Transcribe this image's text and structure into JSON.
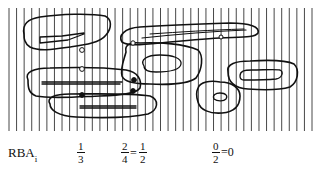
{
  "figure": {
    "type": "ribbon-grid-diagram",
    "vertical_lines": {
      "count": 41,
      "x_start": 9,
      "x_end": 312,
      "y_top": 8,
      "y_bottom": 131,
      "color": "#333333"
    },
    "shape_color": "#111111"
  },
  "labels": {
    "row_label": "RBA",
    "row_label_subscript": "i",
    "values": [
      {
        "num": "1",
        "den": "3"
      },
      {
        "num": "2",
        "den": "4",
        "eq": "=",
        "num2": "1",
        "den2": "2"
      },
      {
        "num": "0",
        "den": "2",
        "eq": "=",
        "result": "0"
      }
    ]
  }
}
